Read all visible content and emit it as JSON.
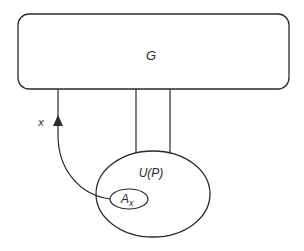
{
  "diagram": {
    "group_box": {
      "label": "G"
    },
    "arrow": {
      "label": "x"
    },
    "outer_set": {
      "label": "U(P)"
    },
    "inner_set": {
      "label_main": "A",
      "label_sub": "x"
    },
    "colors": {
      "stroke": "#2a2a2a",
      "background": "#ffffff"
    }
  }
}
